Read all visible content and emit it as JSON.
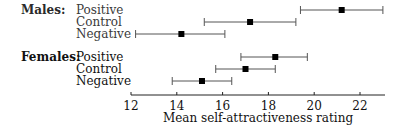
{
  "chart_data": {
    "type": "errorbar",
    "title": "",
    "xlabel": "Mean self-attractiveness rating",
    "ylabel": "",
    "xlim": [
      12,
      23.1
    ],
    "xticks": [
      12,
      14,
      16,
      18,
      20,
      22
    ],
    "grid": false,
    "legend": null,
    "groups": [
      {
        "name": "Males:",
        "rows": [
          {
            "label": "Positive",
            "mean": 21.2,
            "low": 19.4,
            "high": 23.0
          },
          {
            "label": "Control",
            "mean": 17.2,
            "low": 15.2,
            "high": 19.2
          },
          {
            "label": "Negative",
            "mean": 14.2,
            "low": 12.2,
            "high": 16.1
          }
        ]
      },
      {
        "name": "Females:",
        "rows": [
          {
            "label": "Positive",
            "mean": 18.3,
            "low": 16.8,
            "high": 19.7
          },
          {
            "label": "Control",
            "mean": 17.0,
            "low": 15.7,
            "high": 18.3
          },
          {
            "label": "Negative",
            "mean": 15.1,
            "low": 13.8,
            "high": 16.4
          }
        ]
      }
    ]
  },
  "colors": {
    "line": "#555555",
    "marker": "#000000",
    "axis": "#222222"
  }
}
